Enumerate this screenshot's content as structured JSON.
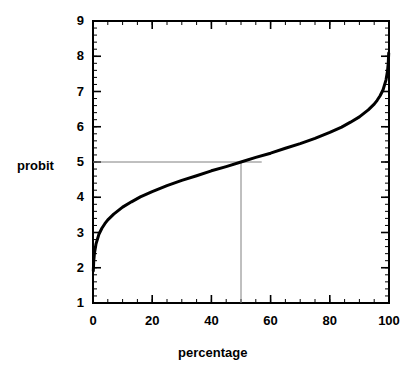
{
  "chart_data": {
    "type": "line",
    "title": "",
    "subtitle": "",
    "xlabel": "percentage",
    "ylabel": "probit",
    "xlim": [
      0,
      100
    ],
    "ylim": [
      1,
      9
    ],
    "xticks": [
      0,
      20,
      40,
      60,
      80,
      100
    ],
    "xtick_labels": [
      "0",
      "20",
      "40",
      "60",
      "80",
      "100"
    ],
    "x_minor_tick_step": 5,
    "yticks": [
      1,
      2,
      3,
      4,
      5,
      6,
      7,
      8,
      9
    ],
    "ytick_labels": [
      "1",
      "2",
      "3",
      "4",
      "5",
      "6",
      "7",
      "8",
      "9"
    ],
    "y_minor_tick_step": 0.2,
    "grid": false,
    "legend": null,
    "series": [
      {
        "name": "probit curve",
        "description": "probit = 5 + inverse-normal(percentage/100)",
        "color": "#000000",
        "linewidth": 3,
        "x": [
          0.1,
          0.25,
          0.5,
          1,
          2,
          3,
          4,
          5,
          7,
          10,
          13,
          16,
          20,
          25,
          30,
          35,
          40,
          45,
          50,
          55,
          60,
          65,
          70,
          75,
          80,
          84,
          87,
          90,
          93,
          95,
          96,
          97,
          98,
          99,
          99.5,
          99.75,
          99.9
        ],
        "y": [
          1.91,
          2.19,
          2.42,
          2.67,
          2.95,
          3.12,
          3.25,
          3.36,
          3.52,
          3.72,
          3.87,
          4.01,
          4.16,
          4.33,
          4.48,
          4.61,
          4.75,
          4.87,
          5.0,
          5.13,
          5.25,
          5.39,
          5.52,
          5.67,
          5.84,
          5.99,
          6.13,
          6.28,
          6.48,
          6.64,
          6.75,
          6.88,
          7.05,
          7.33,
          7.58,
          7.81,
          8.09
        ]
      }
    ],
    "reference_lines": [
      {
        "name": "horizontal-reference-line",
        "orientation": "horizontal",
        "value": 5,
        "axis": "probit",
        "x_start": 0,
        "x_end": 57,
        "color": "#808080",
        "linewidth": 1
      },
      {
        "name": "vertical-reference-line",
        "orientation": "vertical",
        "value": 50,
        "axis": "percentage",
        "y_start": 1,
        "y_end": 5,
        "color": "#808080",
        "linewidth": 1
      }
    ],
    "intersection_point": {
      "percentage": 50,
      "probit": 5
    },
    "colors": {
      "curve": "#000000",
      "axes": "#000000",
      "reference": "#808080",
      "background": "#ffffff"
    }
  }
}
